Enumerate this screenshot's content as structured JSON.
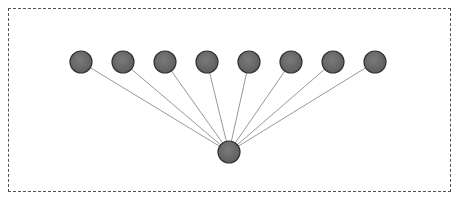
{
  "diagram": {
    "type": "star-tree",
    "frame": {
      "x": 8,
      "y": 8,
      "width": 443,
      "height": 184,
      "border_style": "dashed",
      "border_color": "#555555"
    },
    "node_style": {
      "radius": 11,
      "fill": "#6e6e6e",
      "stroke": "#333333"
    },
    "edge_style": {
      "stroke": "#999999",
      "width": 1
    },
    "root": {
      "id": "root",
      "x": 229,
      "y": 152
    },
    "children": [
      {
        "id": "c1",
        "x": 81,
        "y": 62
      },
      {
        "id": "c2",
        "x": 123,
        "y": 62
      },
      {
        "id": "c3",
        "x": 165,
        "y": 62
      },
      {
        "id": "c4",
        "x": 207,
        "y": 62
      },
      {
        "id": "c5",
        "x": 249,
        "y": 62
      },
      {
        "id": "c6",
        "x": 291,
        "y": 62
      },
      {
        "id": "c7",
        "x": 333,
        "y": 62
      },
      {
        "id": "c8",
        "x": 375,
        "y": 62
      }
    ]
  }
}
